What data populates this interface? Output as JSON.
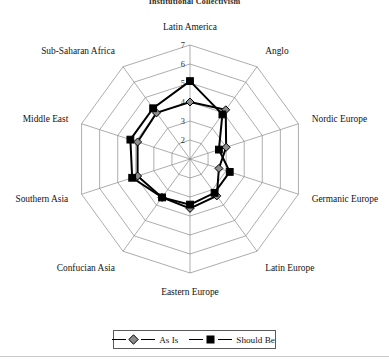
{
  "chart": {
    "title": "Institutional Collectivism",
    "legend": {
      "position": "bottom-center",
      "entries": [
        {
          "label": "As Is",
          "marker": "diamond",
          "color": "#8c8c8c",
          "stroke": "#000000"
        },
        {
          "label": "Should Be",
          "marker": "square",
          "color": "#000000",
          "stroke": "#000000"
        }
      ]
    },
    "scale_ticks": [
      "2",
      "3",
      "4",
      "5",
      "6",
      "7"
    ]
  },
  "chart_data": {
    "type": "radar",
    "title": "Institutional Collectivism",
    "xlabel": "",
    "ylabel": "",
    "rlim": [
      1,
      7
    ],
    "r_ticks": [
      1,
      2,
      3,
      4,
      5,
      6,
      7
    ],
    "r_tick_labels": [
      "",
      "2",
      "3",
      "4",
      "5",
      "6",
      "7"
    ],
    "grid": true,
    "start_angle_deg": 90,
    "direction": "clockwise",
    "categories": [
      "Latin America",
      "Anglo",
      "Nordic Europe",
      "Germanic Europe",
      "Latin Europe",
      "Eastern Europe",
      "Confucian Asia",
      "Southern Asia",
      "Middle East",
      "Sub-Saharan Africa"
    ],
    "series": [
      {
        "name": "As Is",
        "marker": "diamond",
        "values": [
          4.0,
          4.2,
          3.0,
          2.6,
          3.4,
          3.6,
          3.5,
          3.9,
          3.9,
          4.0
        ]
      },
      {
        "name": "Should Be",
        "marker": "square",
        "values": [
          5.1,
          3.9,
          2.6,
          3.2,
          3.2,
          3.4,
          3.5,
          4.2,
          4.3,
          4.3
        ]
      }
    ],
    "legend": [
      "As Is",
      "Should Be"
    ],
    "legend_position": "bottom"
  }
}
